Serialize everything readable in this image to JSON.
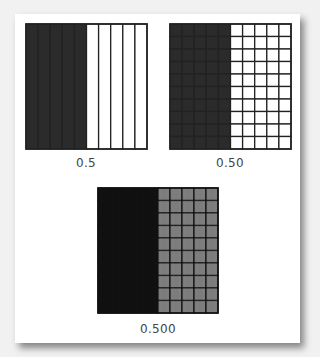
{
  "figure": {
    "models": [
      {
        "label": "0.5",
        "value": 0.5,
        "cols": 10,
        "rows": 1,
        "shaded_cols": 5,
        "shade": "#2b2b2b",
        "unshaded": "#ffffff",
        "line": "#222222"
      },
      {
        "label": "0.50",
        "value": 0.5,
        "cols": 10,
        "rows": 10,
        "shaded_cols": 5,
        "shade": "#2b2b2b",
        "unshaded": "#ffffff",
        "line": "#222222"
      },
      {
        "label": "0.500",
        "value": 0.5,
        "cols": 10,
        "rows": 10,
        "shaded_cols": 5,
        "shade": "#0d0d0d",
        "unshaded": "#7a7a7a",
        "line": "#111111",
        "thousandths": true
      }
    ]
  }
}
